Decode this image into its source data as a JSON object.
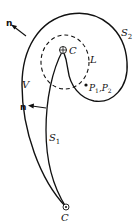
{
  "figure": {
    "labels": {
      "normal_top": "n",
      "normal_mid": "n",
      "surface_2": "S",
      "surface_2_sub": "2",
      "surface_1": "S",
      "surface_1_sub": "1",
      "volume": "V",
      "curve": "L",
      "point_top": "C",
      "point_bottom": "C",
      "points": "P",
      "points_sub1": "1",
      "points_sep": ",P",
      "points_sub2": "2"
    },
    "colors": {
      "stroke": "#111111",
      "background": "#ffffff"
    }
  }
}
